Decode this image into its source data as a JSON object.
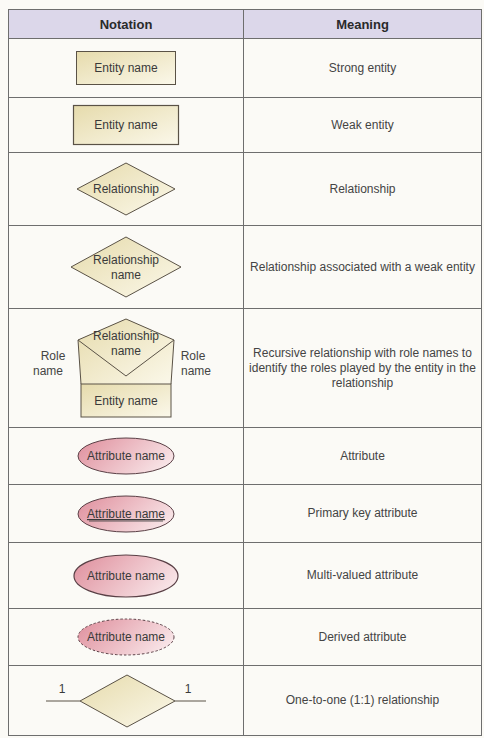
{
  "table": {
    "headers": {
      "notation": "Notation",
      "meaning": "Meaning"
    },
    "rows": [
      {
        "shape": "strong-entity",
        "label": "Entity name",
        "meaning": "Strong entity",
        "height": 59
      },
      {
        "shape": "weak-entity",
        "label": "Entity name",
        "meaning": "Weak entity",
        "height": 55
      },
      {
        "shape": "relationship",
        "label": "Relationship",
        "meaning": "Relationship",
        "height": 73
      },
      {
        "shape": "weak-relationship",
        "label_line1": "Relationship",
        "label_line2": "name",
        "meaning": "Relationship associated with a weak entity",
        "height": 83
      },
      {
        "shape": "recursive-relationship",
        "rel_line1": "Relationship",
        "rel_line2": "name",
        "entity": "Entity name",
        "role_left_1": "Role",
        "role_left_2": "name",
        "role_right_1": "Role",
        "role_right_2": "name",
        "meaning": "Recursive relationship with role names to identify the roles played by the entity in the relationship",
        "height": 119
      },
      {
        "shape": "attribute",
        "label": "Attribute name",
        "meaning": "Attribute",
        "height": 57
      },
      {
        "shape": "primary-key-attribute",
        "label": "Attribute name",
        "meaning": "Primary key attribute",
        "height": 58
      },
      {
        "shape": "multi-valued-attribute",
        "label": "Attribute name",
        "meaning": "Multi-valued attribute",
        "height": 66
      },
      {
        "shape": "derived-attribute",
        "label": "Attribute name",
        "meaning": "Derived attribute",
        "height": 57
      },
      {
        "shape": "one-to-one",
        "left_cardinality": "1",
        "right_cardinality": "1",
        "meaning": "One-to-one (1:1) relationship",
        "height": 70
      }
    ]
  },
  "colors": {
    "header_bg": "#dcd7ea",
    "entity_fill_dark": "#e9dfb4",
    "entity_fill_light": "#faf6e6",
    "attribute_fill_dark": "#e49aa6",
    "attribute_fill_light": "#f8e4e6",
    "border": "#6e6e6e",
    "shape_stroke": "#5a5246"
  }
}
